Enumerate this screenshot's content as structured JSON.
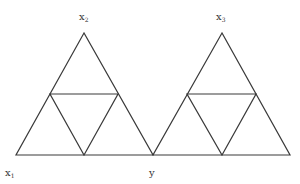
{
  "diagram": {
    "type": "two subdivided triangles sharing vertex y",
    "labels": {
      "x1": {
        "base": "x",
        "sub": "1"
      },
      "x2": {
        "base": "x",
        "sub": "2"
      },
      "x3": {
        "base": "x",
        "sub": "3"
      },
      "y": {
        "base": "y",
        "sub": ""
      }
    },
    "triangles": [
      {
        "name": "left",
        "apex_label": "x2",
        "vertices": [
          [
            84,
            33
          ],
          [
            16,
            155
          ],
          [
            153,
            155
          ]
        ],
        "midpoints": [
          [
            50,
            94
          ],
          [
            118,
            94
          ],
          [
            84,
            155
          ]
        ]
      },
      {
        "name": "right",
        "apex_label": "x3",
        "vertices": [
          [
            222,
            33
          ],
          [
            153,
            155
          ],
          [
            290,
            155
          ]
        ],
        "midpoints": [
          [
            187,
            94
          ],
          [
            256,
            94
          ],
          [
            222,
            155
          ]
        ]
      }
    ],
    "stroke_color": "#3a3a3a"
  }
}
